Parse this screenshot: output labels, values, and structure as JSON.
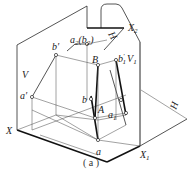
{
  "figure": {
    "caption": "( a )",
    "planes": {
      "V": "V",
      "H": "H",
      "H1": "H",
      "V1": "V"
    },
    "axes": {
      "X": "X",
      "X1": "X",
      "X1_sub": "1",
      "X2": "X",
      "X2_sub": "2"
    },
    "points": {
      "a_prime": "a′",
      "b_prime": "b′",
      "a": "a",
      "b": "b",
      "A": "A",
      "B": "B",
      "a1": "a",
      "a1_sub": "1",
      "b1_prime": "b",
      "b1_prime_sup": "′",
      "b1_prime_sub": "1",
      "a2b2": "a",
      "a2b2_sub": "2",
      "a2b2_paren": "(b",
      "a2b2_paren_sub": "2",
      "a2b2_close": ")",
      "V1_label": "V",
      "V1_sub": "1"
    },
    "colors": {
      "line": "#2a2a2a",
      "background": "#ffffff"
    }
  }
}
